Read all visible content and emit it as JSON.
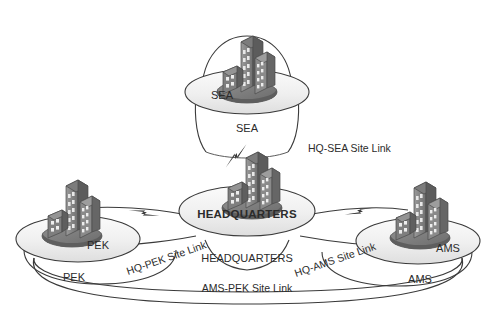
{
  "diagram": {
    "background_color": "#ffffff",
    "line_color": "#3a3a3a",
    "building_color": "#8b8b8b",
    "disc_fill": "#f2f2f2"
  },
  "sites": [
    {
      "id": "sea",
      "label": "SEA",
      "disc_label": "SEA",
      "sub_label": "SEA",
      "icon": "office-buildings-icon",
      "position": "top"
    },
    {
      "id": "headquarters",
      "label": "HEADQUARTERS",
      "disc_label": "HEADQUARTERS",
      "sub_label": "HEADQUARTERS",
      "icon": "office-buildings-icon",
      "position": "center"
    },
    {
      "id": "pek",
      "label": "PEK",
      "disc_label": "PEK",
      "sub_label": "PEK",
      "icon": "office-buildings-icon",
      "position": "left"
    },
    {
      "id": "ams",
      "label": "AMS",
      "disc_label": "AMS",
      "sub_label": "AMS",
      "icon": "office-buildings-icon",
      "position": "right"
    }
  ],
  "site_links": [
    {
      "id": "hq-sea",
      "label": "HQ-SEA Site Link",
      "from": "headquarters",
      "to": "sea",
      "connector_icon": "lightning-bolt-icon"
    },
    {
      "id": "hq-pek",
      "label": "HQ-PEK Site Link",
      "from": "headquarters",
      "to": "pek",
      "connector_icon": "lightning-bolt-icon"
    },
    {
      "id": "hq-ams",
      "label": "HQ-AMS Site Link",
      "from": "headquarters",
      "to": "ams",
      "connector_icon": "lightning-bolt-icon"
    },
    {
      "id": "ams-pek",
      "label": "AMS-PEK Site Link",
      "from": "ams",
      "to": "pek",
      "connector_icon": "none"
    }
  ]
}
